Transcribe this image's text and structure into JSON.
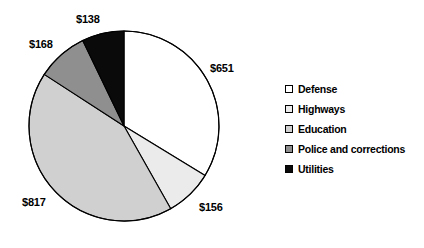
{
  "chart_data": {
    "type": "pie",
    "title": "",
    "subtitle": "",
    "xlabel": "",
    "ylabel": "",
    "grid": false,
    "legend_position": "right",
    "start_angle_deg": 0,
    "direction": "clockwise",
    "total": 1930,
    "units": "dollars",
    "categories": [
      "Defense",
      "Highways",
      "Education",
      "Police and corrections",
      "Utilities"
    ],
    "values": [
      651,
      156,
      817,
      168,
      138
    ],
    "data_labels": [
      "$651",
      "$156",
      "$817",
      "$168",
      "$138"
    ],
    "slice_colors": [
      "#ffffff",
      "#ebebeb",
      "#d0d0d0",
      "#8f8f8f",
      "#0a0a0a"
    ],
    "slice_angles_deg": [
      121.4,
      29.1,
      152.4,
      31.3,
      25.7
    ],
    "slices": [
      {
        "name": "Defense",
        "value": 651,
        "label": "$651",
        "color": "#ffffff",
        "angle_deg": 121.4,
        "percent": 33.7
      },
      {
        "name": "Highways",
        "value": 156,
        "label": "$156",
        "color": "#ebebeb",
        "angle_deg": 29.1,
        "percent": 8.1
      },
      {
        "name": "Education",
        "value": 817,
        "label": "$817",
        "color": "#d0d0d0",
        "angle_deg": 152.4,
        "percent": 42.3
      },
      {
        "name": "Police and corrections",
        "value": 168,
        "label": "$168",
        "color": "#8f8f8f",
        "angle_deg": 31.3,
        "percent": 8.7
      },
      {
        "name": "Utilities",
        "value": 138,
        "label": "$138",
        "color": "#0a0a0a",
        "angle_deg": 25.7,
        "percent": 7.2
      }
    ]
  },
  "labels": {
    "defense": {
      "text": "$651",
      "left": 210,
      "top": 62
    },
    "highways": {
      "text": "$156",
      "left": 199,
      "top": 201
    },
    "education": {
      "text": "$817",
      "left": 22,
      "top": 196
    },
    "police": {
      "text": "$168",
      "left": 29,
      "top": 38
    },
    "utilities": {
      "text": "$138",
      "left": 76,
      "top": 13
    }
  },
  "legend": {
    "items": [
      {
        "label": "Defense",
        "color": "#ffffff"
      },
      {
        "label": "Highways",
        "color": "#ebebeb"
      },
      {
        "label": "Education",
        "color": "#d0d0d0"
      },
      {
        "label": "Police and corrections",
        "color": "#8f8f8f"
      },
      {
        "label": "Utilities",
        "color": "#0a0a0a"
      }
    ]
  },
  "geometry": {
    "center_x": 124,
    "center_y": 126,
    "radius": 95,
    "stroke": "#000000",
    "stroke_width": 1.1
  }
}
